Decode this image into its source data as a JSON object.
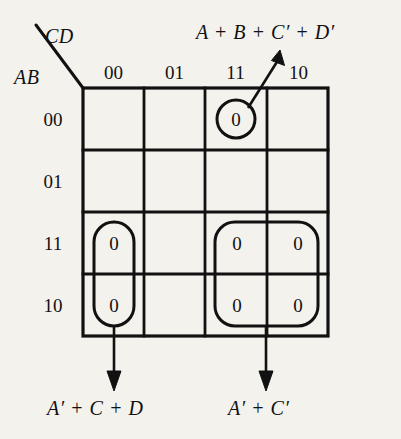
{
  "diagram": {
    "type": "karnaugh-map",
    "title": "",
    "axis_labels": {
      "columns": "CD",
      "rows": "AB"
    },
    "column_headers": [
      "00",
      "01",
      "11",
      "10"
    ],
    "row_headers": [
      "00",
      "01",
      "11",
      "10"
    ],
    "cells": [
      {
        "row": "00",
        "col": "00",
        "value": ""
      },
      {
        "row": "00",
        "col": "01",
        "value": ""
      },
      {
        "row": "00",
        "col": "11",
        "value": "0"
      },
      {
        "row": "00",
        "col": "10",
        "value": ""
      },
      {
        "row": "01",
        "col": "00",
        "value": ""
      },
      {
        "row": "01",
        "col": "01",
        "value": ""
      },
      {
        "row": "01",
        "col": "11",
        "value": ""
      },
      {
        "row": "01",
        "col": "10",
        "value": ""
      },
      {
        "row": "11",
        "col": "00",
        "value": "0"
      },
      {
        "row": "11",
        "col": "01",
        "value": ""
      },
      {
        "row": "11",
        "col": "11",
        "value": "0"
      },
      {
        "row": "11",
        "col": "10",
        "value": "0"
      },
      {
        "row": "10",
        "col": "00",
        "value": "0"
      },
      {
        "row": "10",
        "col": "01",
        "value": ""
      },
      {
        "row": "10",
        "col": "11",
        "value": "0"
      },
      {
        "row": "10",
        "col": "10",
        "value": "0"
      }
    ],
    "groups": [
      {
        "name": "group-single-top",
        "shape": "circle",
        "cells": [
          {
            "row": "00",
            "col": "11"
          }
        ],
        "annotation": "A + B + C′ + D′",
        "arrow": "up-right"
      },
      {
        "name": "group-pair-left",
        "shape": "vertical-oval",
        "cells": [
          {
            "row": "11",
            "col": "00"
          },
          {
            "row": "10",
            "col": "00"
          }
        ],
        "annotation": "A′ + C + D",
        "arrow": "down"
      },
      {
        "name": "group-quad-right",
        "shape": "rounded-rect",
        "cells": [
          {
            "row": "11",
            "col": "11"
          },
          {
            "row": "11",
            "col": "10"
          },
          {
            "row": "10",
            "col": "11"
          },
          {
            "row": "10",
            "col": "10"
          }
        ],
        "annotation": "A′ + C′",
        "arrow": "down"
      }
    ],
    "annotations": {
      "top_right": "A + B + C′ + D′",
      "bottom_left": "A′ + C + D",
      "bottom_right": "A′ + C′"
    },
    "colors": {
      "ink": "#111111",
      "paper": "#f4f2ed"
    }
  }
}
